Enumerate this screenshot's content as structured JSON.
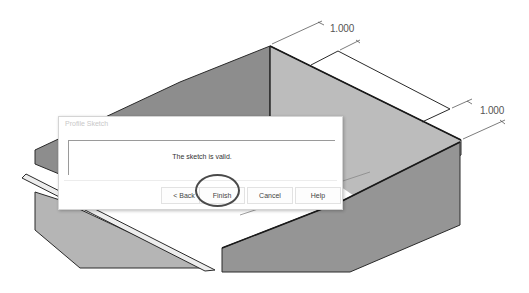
{
  "model_view": {
    "part_type": "sheet-metal-box",
    "dimensions": [
      {
        "id": "top_dimension",
        "value": "1.000"
      },
      {
        "id": "right_dimension",
        "value": "1.000"
      }
    ],
    "colors": {
      "face_dark": "#8a8a8a",
      "face_mid": "#9c9c9c",
      "face_light": "#b9b9b9",
      "edge": "#2a2a2a",
      "background": "#ffffff"
    }
  },
  "dialog": {
    "title": "Profile Sketch",
    "message": "The sketch is valid.",
    "buttons": {
      "back": "< Back",
      "finish": "Finish",
      "cancel": "Cancel",
      "help": "Help"
    },
    "highlighted_button": "finish",
    "highlight_color": "#4a4a4a"
  }
}
